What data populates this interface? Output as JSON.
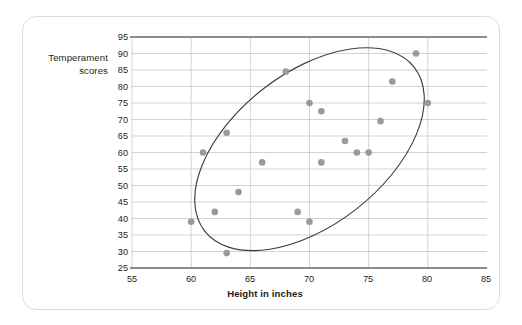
{
  "chart_data": {
    "type": "scatter",
    "title": "",
    "xlabel": "Height in inches",
    "ylabel": "Temperament scores",
    "ylabel_line1": "Temperament",
    "ylabel_line2": "scores",
    "xlim": [
      55,
      85
    ],
    "ylim": [
      25,
      95
    ],
    "xticks": [
      55,
      60,
      65,
      70,
      75,
      80,
      85
    ],
    "yticks": [
      25,
      30,
      35,
      40,
      45,
      50,
      55,
      60,
      65,
      70,
      75,
      80,
      85,
      90,
      95
    ],
    "grid": "horizontal-and-vertical",
    "legend": "none",
    "x": [
      60,
      61,
      62,
      63,
      63,
      64,
      66,
      68,
      69,
      70,
      70,
      71,
      71,
      73,
      74,
      75,
      76,
      77,
      79,
      80
    ],
    "y": [
      39,
      60,
      42,
      66,
      29.5,
      48,
      57,
      84.5,
      42,
      75,
      39,
      72.5,
      57,
      63.5,
      60,
      60,
      69.5,
      81.5,
      90,
      75
    ],
    "points": [
      {
        "x": 60,
        "y": 39
      },
      {
        "x": 61,
        "y": 60
      },
      {
        "x": 62,
        "y": 42
      },
      {
        "x": 63,
        "y": 66
      },
      {
        "x": 63,
        "y": 29.5
      },
      {
        "x": 64,
        "y": 48
      },
      {
        "x": 66,
        "y": 57
      },
      {
        "x": 68,
        "y": 84.5
      },
      {
        "x": 69,
        "y": 42
      },
      {
        "x": 70,
        "y": 75
      },
      {
        "x": 70,
        "y": 39
      },
      {
        "x": 71,
        "y": 72.5
      },
      {
        "x": 71,
        "y": 57
      },
      {
        "x": 73,
        "y": 63.5
      },
      {
        "x": 74,
        "y": 60
      },
      {
        "x": 75,
        "y": 60
      },
      {
        "x": 76,
        "y": 69.5
      },
      {
        "x": 77,
        "y": 81.5
      },
      {
        "x": 79,
        "y": 90
      },
      {
        "x": 80,
        "y": 75
      }
    ],
    "annotations": [
      {
        "type": "ellipse",
        "name": "correlation-ellipse",
        "center_x": 70,
        "center_y": 61,
        "semi_major": 34,
        "semi_minor": 14,
        "rotation_deg": -38,
        "note": "hand-drawn oval enclosing the positively correlated cloud"
      }
    ],
    "colors": {
      "point": "#9a9a9a",
      "gridline": "#c8c8cc",
      "axis": "#8c8c8c",
      "ellipse": "#3f3f3f",
      "text": "#231f20",
      "card_border": "#dcdcdc",
      "background": "#ffffff"
    }
  },
  "xticklabels": [
    "55",
    "60",
    "65",
    "70",
    "75",
    "80",
    "85"
  ],
  "yticklabels": [
    "95",
    "90",
    "85",
    "80",
    "75",
    "70",
    "65",
    "60",
    "55",
    "50",
    "45",
    "40",
    "35",
    "30",
    "25"
  ]
}
